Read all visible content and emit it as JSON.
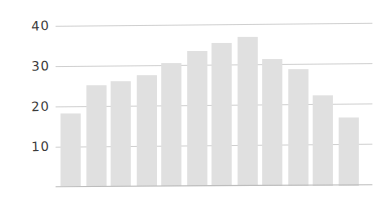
{
  "chart_data": {
    "type": "bar",
    "title": "",
    "subtitle": "",
    "xlabel": "",
    "ylabel": "",
    "categories": [
      "1",
      "2",
      "3",
      "4",
      "5",
      "6",
      "7",
      "8",
      "9",
      "10",
      "11",
      "12"
    ],
    "values": [
      18,
      25,
      26,
      27.5,
      30.5,
      33.5,
      35.5,
      37,
      31.5,
      29,
      22.5,
      17
    ],
    "ylim": [
      0,
      43
    ],
    "yticks": [
      10,
      20,
      30,
      40
    ],
    "ytick_labels": [
      "10",
      "20",
      "30",
      "40"
    ],
    "xticks": [],
    "xtick_labels": [],
    "grid": {
      "horizontal": true,
      "vertical": false,
      "color": "#c9c9c9"
    },
    "legend": {
      "visible": false,
      "position": "none",
      "entries": []
    },
    "annotations": [],
    "style": "hand-drawn-sketch",
    "bar_color": "#e0e0e0",
    "axis_color": "#bdbdbd",
    "label_color": "#3a3a3a",
    "background_color": "#ffffff"
  }
}
